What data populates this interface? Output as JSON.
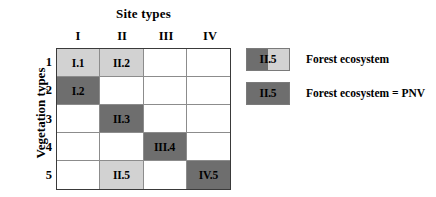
{
  "figure": {
    "column_group_title": "Site types",
    "row_group_title": "Vegetation types",
    "column_headers": [
      "I",
      "II",
      "III",
      "IV"
    ],
    "row_headers": [
      "1",
      "2",
      "3",
      "4",
      "5"
    ]
  },
  "colors": {
    "fill_light": "#d2d2d2",
    "fill_dark": "#6e6e6e",
    "empty": "#ffffff",
    "grid_line": "#8c8c8c",
    "grid_border": "#3a3a3a",
    "text": "#000000"
  },
  "matrix": {
    "rows": [
      {
        "row_label": "1",
        "cells": [
          {
            "label": "I.1",
            "fill": "light"
          },
          {
            "label": "II.2",
            "fill": "light"
          },
          {
            "label": "",
            "fill": "none"
          },
          {
            "label": "",
            "fill": "none"
          }
        ]
      },
      {
        "row_label": "2",
        "cells": [
          {
            "label": "I.2",
            "fill": "dark"
          },
          {
            "label": "",
            "fill": "none"
          },
          {
            "label": "",
            "fill": "none"
          },
          {
            "label": "",
            "fill": "none"
          }
        ]
      },
      {
        "row_label": "3",
        "cells": [
          {
            "label": "",
            "fill": "none"
          },
          {
            "label": "II.3",
            "fill": "dark"
          },
          {
            "label": "",
            "fill": "none"
          },
          {
            "label": "",
            "fill": "none"
          }
        ]
      },
      {
        "row_label": "4",
        "cells": [
          {
            "label": "",
            "fill": "none"
          },
          {
            "label": "",
            "fill": "none"
          },
          {
            "label": "III.4",
            "fill": "dark"
          },
          {
            "label": "",
            "fill": "none"
          }
        ]
      },
      {
        "row_label": "5",
        "cells": [
          {
            "label": "",
            "fill": "none"
          },
          {
            "label": "II.5",
            "fill": "light"
          },
          {
            "label": "",
            "fill": "none"
          },
          {
            "label": "IV.5",
            "fill": "dark"
          }
        ]
      }
    ]
  },
  "legend": {
    "items": [
      {
        "swatch_label": "II.5",
        "text": "Forest ecosystem",
        "swatch_left_fill": "#6e6e6e",
        "swatch_right_fill": "#d2d2d2"
      },
      {
        "swatch_label": "II.5",
        "text": "Forest ecosystem = PNV",
        "swatch_left_fill": "#6e6e6e",
        "swatch_right_fill": "#6e6e6e"
      }
    ]
  }
}
